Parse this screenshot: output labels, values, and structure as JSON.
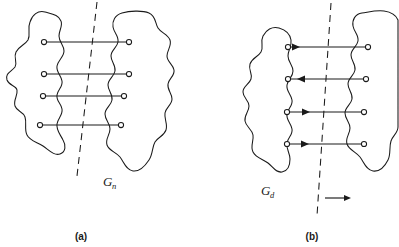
{
  "figure": {
    "type": "graph-partition-diagram",
    "background_color": "#ffffff",
    "ink_color": "#1a1a1a",
    "panels": [
      {
        "id": "a",
        "caption": "(a)",
        "graph_label_base": "G",
        "graph_label_subscript": "n",
        "graph_kind": "undirected",
        "node_count": 8,
        "edge_count": 4,
        "cut_line": "dashed",
        "edges": [
          {
            "row": 1,
            "y": 42,
            "x_left": 42,
            "x_right": 129,
            "directed": false,
            "direction": "none"
          },
          {
            "row": 2,
            "y": 74,
            "x_left": 42,
            "x_right": 129,
            "directed": false,
            "direction": "none"
          },
          {
            "row": 3,
            "y": 96,
            "x_left": 41,
            "x_right": 124,
            "directed": false,
            "direction": "none"
          },
          {
            "row": 4,
            "y": 125,
            "x_left": 38,
            "x_right": 121,
            "directed": false,
            "direction": "none"
          }
        ]
      },
      {
        "id": "b",
        "caption": "(b)",
        "graph_label_base": "G",
        "graph_label_subscript": "d",
        "graph_kind": "directed",
        "node_count": 8,
        "edge_count": 4,
        "cut_line": "dashed",
        "cut_direction_arrow": "right",
        "edges": [
          {
            "row": 1,
            "y": 47,
            "x_left": 288,
            "x_right": 368,
            "directed": true,
            "direction": "right"
          },
          {
            "row": 2,
            "y": 79,
            "x_left": 288,
            "x_right": 366,
            "directed": true,
            "direction": "left"
          },
          {
            "row": 3,
            "y": 112,
            "x_left": 287,
            "x_right": 364,
            "directed": true,
            "direction": "right"
          },
          {
            "row": 4,
            "y": 144,
            "x_left": 287,
            "x_right": 364,
            "directed": true,
            "direction": "right"
          }
        ]
      }
    ]
  }
}
